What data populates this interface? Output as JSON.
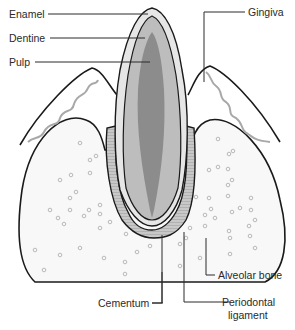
{
  "labels": {
    "enamel": "Enamel",
    "dentine": "Dentine",
    "pulp": "Pulp",
    "gingiva": "Gingiva",
    "cementum": "Cementum",
    "alveolar_bone": "Alveolar bone",
    "periodontal_ligament_line1": "Periodontal",
    "periodontal_ligament_line2": "ligament"
  },
  "colors": {
    "enamel": "#e6e6e6",
    "dentine": "#bdbdbd",
    "pulp": "#8c8c8c",
    "bone": "#f7f7f7",
    "gum_wave": "#a8a8a8",
    "outline": "#1a1a1a"
  }
}
